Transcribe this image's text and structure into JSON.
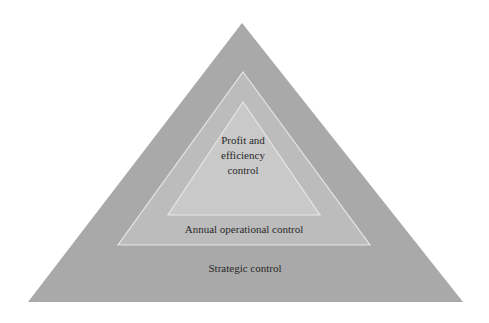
{
  "diagram": {
    "type": "nested-pyramid",
    "colors": {
      "background": "#ffffff",
      "outer_fill": "#a9a9a9",
      "middle_fill": "#bcbcbc",
      "inner_fill": "#c9c9c9",
      "border": "#e6e6e6",
      "text": "#2a2a2a"
    },
    "levels": [
      {
        "id": "inner",
        "label_lines": [
          "Profit and",
          "efficiency",
          "control"
        ],
        "label": "Profit and efficiency control"
      },
      {
        "id": "middle",
        "label": "Annual operational control"
      },
      {
        "id": "outer",
        "label": "Strategic control"
      }
    ]
  }
}
